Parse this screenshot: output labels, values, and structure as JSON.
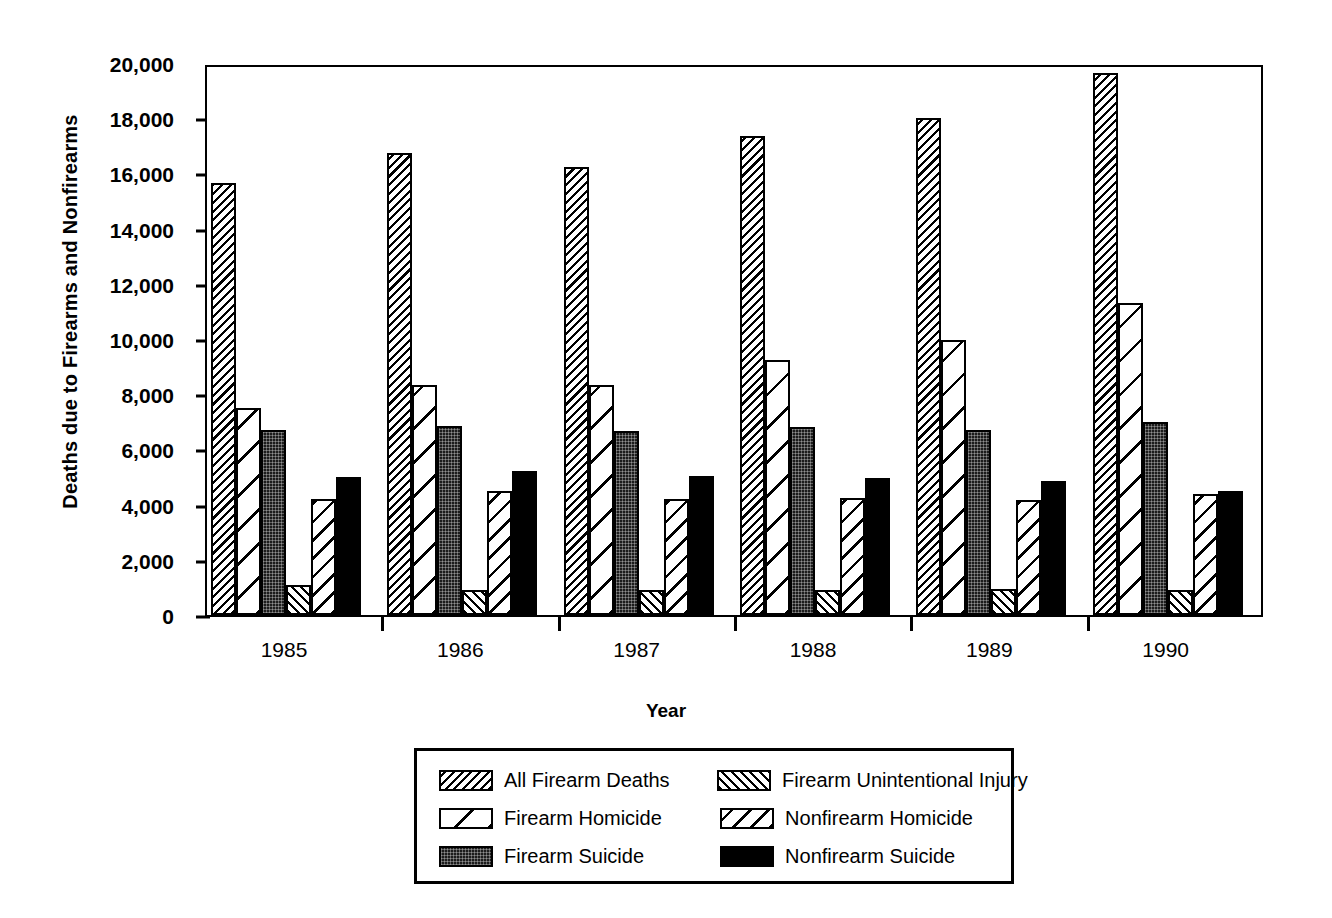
{
  "chart_data": {
    "type": "bar",
    "title": "",
    "xlabel": "Year",
    "ylabel": "Deaths due to Firearms and Nonfirearms",
    "categories": [
      "1985",
      "1986",
      "1987",
      "1988",
      "1989",
      "1990"
    ],
    "ylim": [
      0,
      20000
    ],
    "ytick_labels": [
      "20,000",
      "18,000",
      "16,000",
      "14,000",
      "12,000",
      "10,000",
      "8,000",
      "6,000",
      "4,000",
      "2,000",
      "0"
    ],
    "ytick_values": [
      20000,
      18000,
      16000,
      14000,
      12000,
      10000,
      8000,
      6000,
      4000,
      2000,
      0
    ],
    "grid": false,
    "legend_position": "bottom",
    "series": [
      {
        "name": "All Firearm Deaths",
        "pattern": "diagonal-dense-backslash",
        "values": [
          15650,
          16750,
          16250,
          17350,
          18000,
          19650
        ]
      },
      {
        "name": "Firearm Homicide",
        "pattern": "diagonal-sparse-backslash",
        "values": [
          7500,
          8350,
          8350,
          9250,
          9950,
          11300
        ]
      },
      {
        "name": "Firearm Suicide",
        "pattern": "dark-stipple",
        "values": [
          6700,
          6850,
          6650,
          6800,
          6700,
          7000
        ]
      },
      {
        "name": "Firearm Unintentional Injury",
        "pattern": "diagonal-dense-slash",
        "values": [
          1100,
          900,
          900,
          900,
          950,
          900
        ]
      },
      {
        "name": "Nonfirearm Homicide",
        "pattern": "diagonal-medium-backslash",
        "values": [
          4200,
          4500,
          4200,
          4250,
          4150,
          4400
        ]
      },
      {
        "name": "Nonfirearm Suicide",
        "pattern": "solid-black",
        "values": [
          5000,
          5200,
          5050,
          4950,
          4850,
          4500
        ]
      }
    ]
  },
  "legend": {
    "rows": [
      {
        "left": "All Firearm Deaths",
        "right": "Firearm Unintentional Injury"
      },
      {
        "left": "Firearm Homicide",
        "right": "Nonfirearm Homicide"
      },
      {
        "left": "Firearm Suicide",
        "right": "Nonfirearm Suicide"
      }
    ]
  },
  "colors": {
    "ink": "#000000",
    "paper": "#ffffff",
    "suicide_fill": "#1c1c1c"
  }
}
